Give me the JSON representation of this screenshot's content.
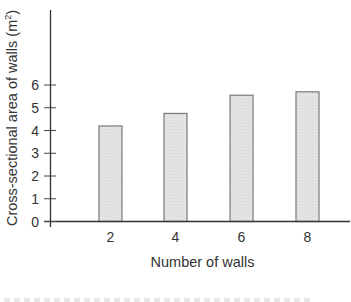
{
  "chart_data": {
    "type": "bar",
    "title": "",
    "xlabel": "Number of walls",
    "ylabel": "Cross-sectional area of walls (m²)",
    "ylabel_main": "Cross-sectional area of walls (m",
    "ylabel_sup": "2",
    "ylabel_close": ")",
    "categories": [
      "2",
      "4",
      "6",
      "8"
    ],
    "values": [
      4.2,
      4.75,
      5.55,
      5.7
    ],
    "ylim": [
      0,
      6
    ],
    "yticks": [
      0,
      1,
      2,
      3,
      4,
      5,
      6
    ],
    "grid": false,
    "legend": null,
    "bar_fill": "#e4e4e4",
    "bar_stroke": "#7a7a7a",
    "axis_color": "#333333"
  }
}
